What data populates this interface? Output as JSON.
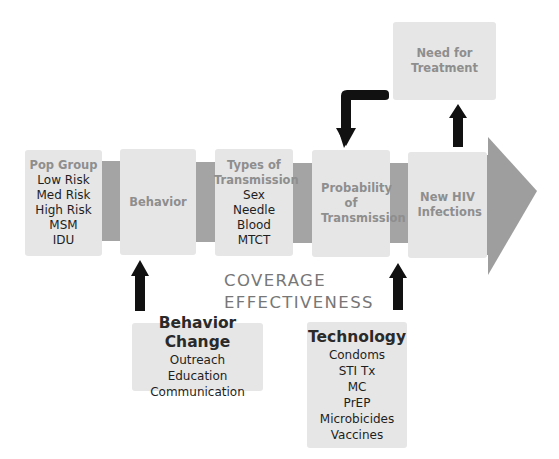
{
  "diagram": {
    "pipeline": [
      {
        "header": "Pop Group",
        "items": [
          "Low Risk",
          "Med Risk",
          "High Risk",
          "MSM",
          "IDU"
        ]
      },
      {
        "header": "Behavior",
        "items": []
      },
      {
        "header": "Types of Transmission",
        "items": [
          "Sex",
          "Needle",
          "Blood",
          "MTCT"
        ]
      },
      {
        "header": "Probability of Transmission",
        "items": []
      },
      {
        "header": "New HIV Infections",
        "items": []
      }
    ],
    "outcome": {
      "header": "Need for Treatment"
    },
    "center_label": {
      "line1": "COVERAGE",
      "line2": "EFFECTIVENESS"
    },
    "interventions": [
      {
        "title": "Behavior Change",
        "items": [
          "Outreach",
          "Education",
          "Communication"
        ]
      },
      {
        "title": "Technology",
        "items": [
          "Condoms",
          "STI Tx",
          "MC",
          "PrEP",
          "Microbicides",
          "Vaccines"
        ]
      }
    ],
    "colors": {
      "box_fill": "#e6e6e6",
      "connector_fill": "#a4a4a4",
      "big_arrow_fill": "#9e9e9e",
      "arrow_fill": "#111111",
      "header_text": "#8e8e8e",
      "item_text": "#1e1e1e"
    }
  }
}
